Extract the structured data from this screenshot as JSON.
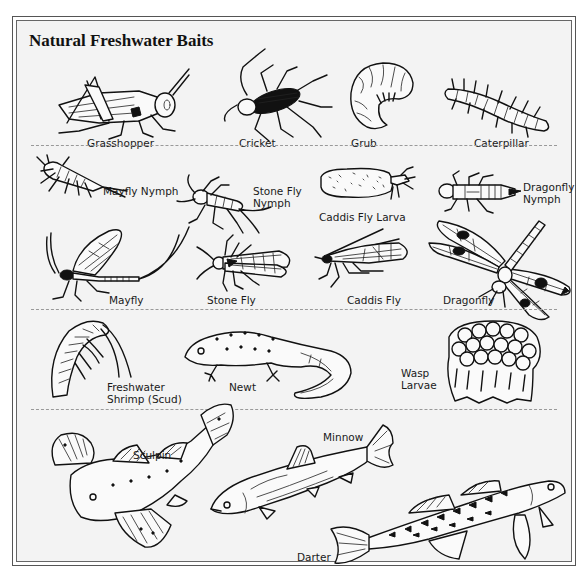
{
  "title": "Natural Freshwater Baits",
  "colors": {
    "ink": "#111111",
    "paper": "#f3f3f3",
    "border": "#555555",
    "divider": "#999999"
  },
  "sections": [
    {
      "name": "terrestrial-insects",
      "items": [
        {
          "id": "grasshopper",
          "label": "Grasshopper"
        },
        {
          "id": "cricket",
          "label": "Cricket"
        },
        {
          "id": "grub",
          "label": "Grub"
        },
        {
          "id": "caterpillar",
          "label": "Caterpillar"
        }
      ]
    },
    {
      "name": "aquatic-insects",
      "items": [
        {
          "id": "mayfly-nymph",
          "label": "Mayfly Nymph"
        },
        {
          "id": "stone-fly-nymph",
          "label_line1": "Stone Fly",
          "label_line2": "Nymph"
        },
        {
          "id": "caddis-fly-larva",
          "label": "Caddis Fly Larva"
        },
        {
          "id": "dragonfly-nymph",
          "label_line1": "Dragonfly",
          "label_line2": "Nymph"
        },
        {
          "id": "mayfly",
          "label": "Mayfly"
        },
        {
          "id": "stone-fly",
          "label": "Stone Fly"
        },
        {
          "id": "caddis-fly",
          "label": "Caddis Fly"
        },
        {
          "id": "dragonfly",
          "label": "Dragonfly"
        }
      ]
    },
    {
      "name": "other-baits",
      "items": [
        {
          "id": "freshwater-shrimp",
          "label_line1": "Freshwater",
          "label_line2": "Shrimp (Scud)"
        },
        {
          "id": "newt",
          "label": "Newt"
        },
        {
          "id": "wasp-larvae",
          "label_line1": "Wasp",
          "label_line2": "Larvae"
        }
      ]
    },
    {
      "name": "baitfish",
      "items": [
        {
          "id": "sculpin",
          "label": "Sculpin"
        },
        {
          "id": "minnow",
          "label": "Minnow"
        },
        {
          "id": "darter",
          "label": "Darter"
        }
      ]
    }
  ]
}
